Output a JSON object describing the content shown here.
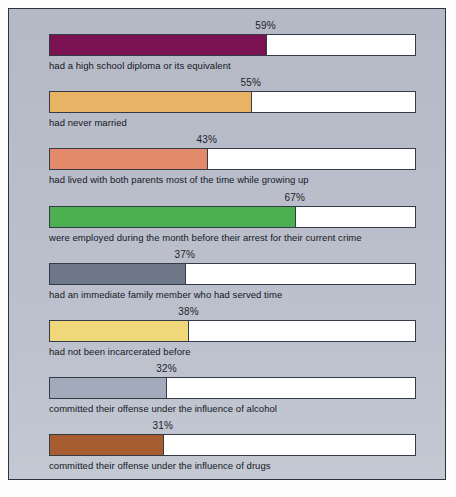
{
  "figure": {
    "background_color": "#ffffff",
    "panel_color": "#b7bcc8",
    "border_color": "#2c3340",
    "text_color": "#14181f"
  },
  "chart_data": {
    "type": "bar",
    "orientation": "horizontal",
    "title": "",
    "subtitle": "",
    "xlabel": "",
    "ylabel": "",
    "xlim": [
      0,
      100
    ],
    "grid": false,
    "legend": false,
    "value_suffix": "%",
    "categories": [
      "had a high school diploma or its equivalent",
      "had never married",
      "had lived with both parents most of the time while growing up",
      "were employed during the month before their arrest for their current crime",
      "had an immediate family member who had served time",
      "had not been incarcerated before",
      "committed their offense under the influence of alcohol",
      "committed their offense under the influence of drugs"
    ],
    "values": [
      59,
      55,
      43,
      67,
      37,
      38,
      32,
      31
    ],
    "value_labels": [
      "59%",
      "55%",
      "43%",
      "67%",
      "37%",
      "38%",
      "32%",
      "31%"
    ],
    "colors": [
      "#7a1150",
      "#e9b365",
      "#e28a6a",
      "#4caf50",
      "#6f7888",
      "#f0d87a",
      "#a2aabb",
      "#a85d31"
    ]
  },
  "bars": [
    {
      "label": "had a high school diploma or its equivalent",
      "value": 59,
      "value_label": "59%",
      "color": "#7a1150"
    },
    {
      "label": "had never married",
      "value": 55,
      "value_label": "55%",
      "color": "#e9b365"
    },
    {
      "label": "had lived with both parents most of the time while growing up",
      "value": 43,
      "value_label": "43%",
      "color": "#e28a6a"
    },
    {
      "label": "were employed during the month before their arrest for their current crime",
      "value": 67,
      "value_label": "67%",
      "color": "#4caf50"
    },
    {
      "label": "had an immediate family member who had served time",
      "value": 37,
      "value_label": "37%",
      "color": "#6f7888"
    },
    {
      "label": "had not been incarcerated before",
      "value": 38,
      "value_label": "38%",
      "color": "#f0d87a"
    },
    {
      "label": "committed their offense under the influence of alcohol",
      "value": 32,
      "value_label": "32%",
      "color": "#a2aabb"
    },
    {
      "label": "committed their offense under the influence of drugs",
      "value": 31,
      "value_label": "31%",
      "color": "#a85d31"
    }
  ]
}
